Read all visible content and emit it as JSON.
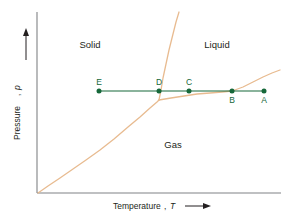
{
  "chart_data": {
    "type": "line",
    "title": "",
    "xlabel": "Temperature",
    "xlabel_symbol": "T",
    "ylabel": "Pressure",
    "ylabel_symbol": "p",
    "grid": false,
    "legend": "none",
    "axis_arrows": {
      "x": "right-arrow",
      "y": "up-arrow"
    },
    "regions": [
      {
        "name": "solid",
        "label": "Solid",
        "x": 90,
        "y": 48
      },
      {
        "name": "liquid",
        "label": "Liquid",
        "x": 217,
        "y": 48
      },
      {
        "name": "gas",
        "label": "Gas",
        "x": 173,
        "y": 148
      }
    ],
    "series": [
      {
        "name": "sublimation-curve",
        "color": "#e8bb90",
        "points": [
          [
            38,
            193
          ],
          [
            48,
            186
          ],
          [
            60,
            178
          ],
          [
            73,
            169
          ],
          [
            86,
            160
          ],
          [
            100,
            150
          ],
          [
            114,
            139
          ],
          [
            128,
            127
          ],
          [
            140,
            117
          ],
          [
            150,
            108
          ],
          [
            157,
            102
          ],
          [
            159,
            100
          ]
        ]
      },
      {
        "name": "fusion-curve",
        "color": "#e8bb90",
        "points": [
          [
            159,
            100
          ],
          [
            161,
            90
          ],
          [
            163,
            78
          ],
          [
            166,
            64
          ],
          [
            169,
            50
          ],
          [
            173,
            34
          ],
          [
            176,
            22
          ],
          [
            179,
            12
          ]
        ]
      },
      {
        "name": "vaporization-curve",
        "color": "#e8bb90",
        "points": [
          [
            159,
            100
          ],
          [
            171,
            98
          ],
          [
            184,
            96
          ],
          [
            197,
            94
          ],
          [
            210,
            93
          ],
          [
            222,
            92
          ],
          [
            232,
            91
          ],
          [
            243,
            87
          ],
          [
            253,
            82
          ],
          [
            263,
            77
          ],
          [
            272,
            73
          ],
          [
            280,
            70
          ]
        ]
      },
      {
        "name": "isobar-path",
        "color": "#16683a",
        "points": [
          [
            99,
            91
          ],
          [
            264,
            91
          ]
        ]
      }
    ],
    "markers": [
      {
        "id": "E",
        "label": "E",
        "x": 99,
        "y": 91,
        "label_position": "above"
      },
      {
        "id": "D",
        "label": "D",
        "x": 159,
        "y": 91,
        "label_position": "above"
      },
      {
        "id": "C",
        "label": "C",
        "x": 189,
        "y": 91,
        "label_position": "above"
      },
      {
        "id": "B",
        "label": "B",
        "x": 232,
        "y": 91,
        "label_position": "below"
      },
      {
        "id": "A",
        "label": "A",
        "x": 264,
        "y": 91,
        "label_position": "below"
      }
    ],
    "colors": {
      "curve": "#e8bb90",
      "isobar": "#16683a",
      "marker": "#16683a",
      "axis": "#808285",
      "text": "#231f20",
      "background": "#ffffff"
    },
    "axis_frame": {
      "x_axis_y": 193,
      "y_axis_x": 37,
      "x_axis_start": 37,
      "x_axis_end": 281,
      "y_axis_top": 12,
      "y_axis_bottom": 193
    }
  }
}
